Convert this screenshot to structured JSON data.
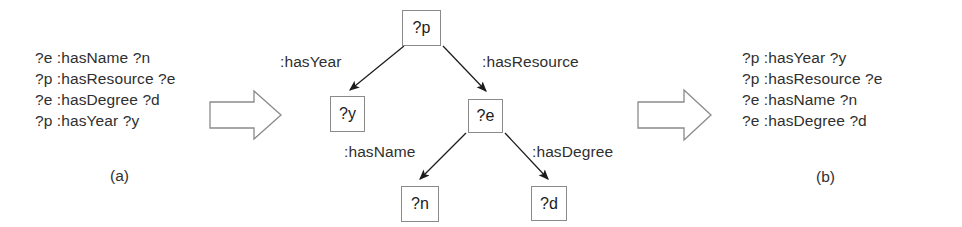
{
  "figure": {
    "type": "query-rewriting-diagram",
    "stroke_color": "#8a8a8a",
    "text_color": "#2f2f2f",
    "background": "#ffffff"
  },
  "panel_a": {
    "caption": "(a)",
    "triples": [
      "?e :hasName ?n",
      "?p :hasResource ?e",
      "?e :hasDegree ?d",
      "?p :hasYear ?y"
    ]
  },
  "panel_b": {
    "caption": "(b)",
    "triples": [
      "?p :hasYear ?y",
      "?p :hasResource ?e",
      "?e :hasName ?n",
      "?e :hasDegree ?d"
    ]
  },
  "tree": {
    "nodes": [
      {
        "id": "p",
        "label": "?p"
      },
      {
        "id": "y",
        "label": "?y"
      },
      {
        "id": "e",
        "label": "?e"
      },
      {
        "id": "n",
        "label": "?n"
      },
      {
        "id": "d",
        "label": "?d"
      }
    ],
    "edges": [
      {
        "from": "p",
        "to": "y",
        "label": ":hasYear"
      },
      {
        "from": "p",
        "to": "e",
        "label": ":hasResource"
      },
      {
        "from": "e",
        "to": "n",
        "label": ":hasName"
      },
      {
        "from": "e",
        "to": "d",
        "label": ":hasDegree"
      }
    ]
  },
  "transform_arrows": [
    {
      "name": "left-transform-arrow",
      "direction": "right"
    },
    {
      "name": "right-transform-arrow",
      "direction": "right"
    }
  ]
}
